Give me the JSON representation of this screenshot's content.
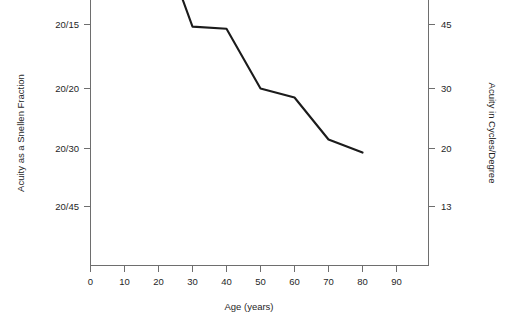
{
  "chart_data": {
    "type": "line",
    "title": "",
    "xlabel": "Age (years)",
    "ylabel": "Acuity as a Snellen Fraction",
    "ylabel_right": "Acuity in Cycles/Degree",
    "grid": false,
    "legend": false,
    "xlim": [
      0,
      98
    ],
    "xticks": [
      0,
      10,
      20,
      30,
      40,
      50,
      60,
      70,
      80,
      90
    ],
    "xticklabels": [
      "0",
      "10",
      "20",
      "30",
      "40",
      "50",
      "60",
      "70",
      "80",
      "90"
    ],
    "yticklabels_left": [
      "20/15",
      "20/20",
      "20/30",
      "20/45"
    ],
    "yticklabels_right": [
      "45",
      "30",
      "20",
      "13"
    ],
    "ytickvalues_cycles": [
      45,
      30,
      20,
      13
    ],
    "x": [
      20,
      30,
      40,
      50,
      60,
      70,
      80
    ],
    "values": [
      46,
      44.5,
      44,
      30,
      28.5,
      21.5,
      19.5
    ],
    "series": [
      {
        "name": "Visual acuity vs age",
        "x": [
          20,
          30,
          40,
          50,
          60,
          70,
          80
        ],
        "values": [
          46,
          44.5,
          44,
          30,
          28.5,
          21.5,
          19.5
        ],
        "snellen": [
          "20/13",
          "20/15",
          "20/15",
          "20/20",
          "20/21",
          "20/28",
          "20/31"
        ],
        "color": "#1b1b1b"
      }
    ],
    "line_color": "#1b1b1b",
    "axis_color": "#6e6e6e",
    "background": "#ffffff"
  },
  "axes": {
    "x_title": "Age (years)",
    "y_left_title": "Acuity as a Snellen Fraction",
    "y_right_title": "Acuity in Cycles/Degree",
    "x_ticks": [
      {
        "label": "0"
      },
      {
        "label": "10"
      },
      {
        "label": "20"
      },
      {
        "label": "30"
      },
      {
        "label": "40"
      },
      {
        "label": "50"
      },
      {
        "label": "60"
      },
      {
        "label": "70"
      },
      {
        "label": "80"
      },
      {
        "label": "90"
      }
    ],
    "y_left_ticks": [
      {
        "label": "20/15"
      },
      {
        "label": "20/20"
      },
      {
        "label": "20/30"
      },
      {
        "label": "20/45"
      }
    ],
    "y_right_ticks": [
      {
        "label": "45"
      },
      {
        "label": "30"
      },
      {
        "label": "20"
      },
      {
        "label": "13"
      }
    ]
  }
}
